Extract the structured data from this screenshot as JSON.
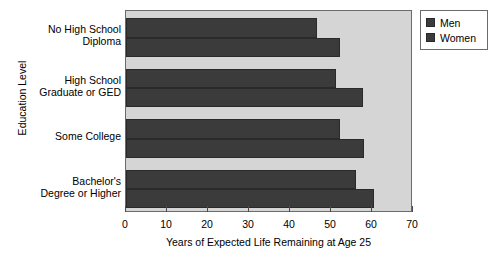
{
  "chart_data": {
    "type": "bar",
    "orientation": "horizontal",
    "title": "",
    "xlabel": "Years of Expected Life Remaining at Age 25",
    "ylabel": "Education Level",
    "categories": [
      "No High School\nDiploma",
      "High School\nGraduate or GED",
      "Some College",
      "Bachelor's\nDegree or Higher"
    ],
    "series": [
      {
        "name": "Men",
        "values": [
          46.6,
          51.1,
          52.2,
          56.2
        ],
        "color": "#3b3b3b"
      },
      {
        "name": "Women",
        "values": [
          52.2,
          57.7,
          58.1,
          60.6
        ],
        "color": "#3b3b3b"
      }
    ],
    "xlim": [
      0,
      70
    ],
    "xticks": [
      0,
      10,
      20,
      30,
      40,
      50,
      60,
      70
    ],
    "xtick_labels": [
      "0",
      "10",
      "20",
      "30",
      "40",
      "50",
      "60",
      "70"
    ],
    "grid": false,
    "legend_position": "upper right",
    "plot_background": "#d5d5d5",
    "figure_background": "#ffffff"
  },
  "legend": {
    "entries": [
      {
        "label": "Men"
      },
      {
        "label": "Women"
      }
    ]
  }
}
